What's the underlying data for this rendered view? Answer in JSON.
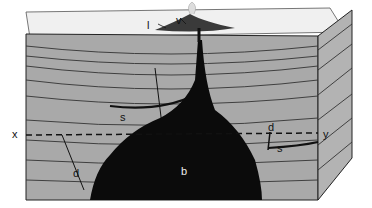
{
  "diagram": {
    "type": "geological-block-diagram",
    "labels": {
      "l": "l",
      "v": "v",
      "s_top": "s",
      "s_right": "s",
      "d_left": "d",
      "d_right": "d",
      "b": "b",
      "x": "x",
      "y": "y"
    },
    "colors": {
      "rock": "#a8a8a8",
      "surface": "#f2f2f2",
      "magma": "#0b0b0b",
      "lines": "#222222"
    }
  }
}
